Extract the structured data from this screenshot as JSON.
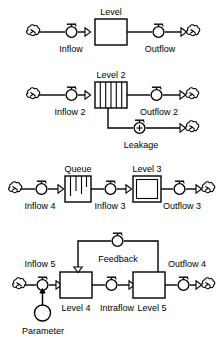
{
  "document": {
    "title": "Stock and Flow Diagram Notation",
    "background_color": "#ffffff",
    "line_color": "#000000",
    "text_color": "#000000"
  },
  "diagrams": [
    {
      "id": "diagram-1",
      "name": "simple-level",
      "labels": {
        "stock": "Level",
        "inflow": "Inflow",
        "outflow": "Outflow"
      },
      "icons": {
        "source": "cloud-icon",
        "sink": "cloud-icon",
        "inflow_valve": "valve-icon",
        "outflow_valve": "valve-icon",
        "stock": "rectangle-stock-icon"
      }
    },
    {
      "id": "diagram-2",
      "name": "level-with-leakage",
      "labels": {
        "stock": "Level 2",
        "inflow": "Inflow 2",
        "outflow": "Outflow 2",
        "leakage": "Leakage"
      },
      "icons": {
        "source": "cloud-icon",
        "sink": "cloud-icon",
        "leakage_sink": "cloud-icon",
        "inflow_valve": "valve-icon",
        "outflow_valve": "valve-icon",
        "leakage_valve": "valve-plus-icon",
        "stock": "striped-stock-icon"
      }
    },
    {
      "id": "diagram-3",
      "name": "queue-and-level",
      "labels": {
        "queue": "Queue",
        "stock": "Level 3",
        "inflow_left": "Inflow 4",
        "inflow_mid": "Inflow 3",
        "outflow": "Outflow 3"
      },
      "icons": {
        "source": "cloud-icon",
        "sink": "cloud-icon",
        "queue": "queue-stock-icon",
        "stock": "double-rectangle-stock-icon",
        "inflow_left_valve": "valve-icon",
        "inflow_mid_valve": "valve-icon",
        "outflow_valve": "valve-icon"
      }
    },
    {
      "id": "diagram-4",
      "name": "feedback-loop",
      "labels": {
        "inflow": "Inflow 5",
        "stock_left": "Level 4",
        "intraflow": "Intraflow",
        "stock_right": "Level 5",
        "outflow": "Outflow 4",
        "feedback": "Feedback",
        "parameter": "Parameter"
      },
      "icons": {
        "source": "cloud-icon",
        "sink": "cloud-icon",
        "inflow_valve": "valve-icon",
        "intraflow_valve": "valve-icon",
        "outflow_valve": "valve-icon",
        "feedback_valve": "valve-icon",
        "parameter": "circle-parameter-icon",
        "stock_left": "rectangle-stock-icon",
        "stock_right": "rectangle-stock-icon"
      }
    }
  ]
}
